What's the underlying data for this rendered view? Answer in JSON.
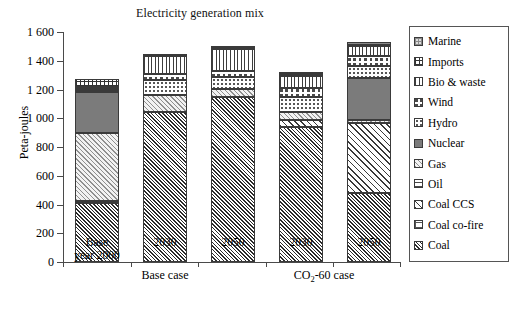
{
  "chart_data": {
    "type": "bar",
    "title": "Electricity generation mix",
    "xlabel": "",
    "ylabel": "Peta-joules",
    "ylim": [
      0,
      1600
    ],
    "yticks": [
      0,
      200,
      400,
      600,
      800,
      1000,
      1200,
      1400,
      1600
    ],
    "ytick_labels": [
      "0",
      "200",
      "400",
      "600",
      "800",
      "1 000",
      "1 200",
      "1 400",
      "1 600"
    ],
    "grid": false,
    "stacked": true,
    "legend_position": "right",
    "categories": [
      "Base year 2000",
      "2030",
      "2050",
      "2030",
      "2050"
    ],
    "category_lines": [
      [
        "Base",
        "year 2000"
      ],
      [
        "2030"
      ],
      [
        "2050"
      ],
      [
        "2030"
      ],
      [
        "2050"
      ]
    ],
    "groups": [
      {
        "label": "Base case",
        "categories": [
          "Base year 2000",
          "2030",
          "2050"
        ]
      },
      {
        "label": "CO2-60 case",
        "categories": [
          "2030",
          "2050"
        ]
      }
    ],
    "series": [
      {
        "name": "Coal",
        "pattern": "dense-diagonal-hatch",
        "values": [
          410,
          1045,
          1150,
          940,
          480
        ]
      },
      {
        "name": "Coal co-fire",
        "pattern": "fine-grid",
        "values": [
          15,
          0,
          0,
          0,
          0
        ]
      },
      {
        "name": "Coal CCS",
        "pattern": "wide-diagonal-hatch",
        "values": [
          0,
          0,
          0,
          45,
          490
        ]
      },
      {
        "name": "Oil",
        "pattern": "horizontal-lines",
        "values": [
          0,
          0,
          0,
          0,
          0
        ]
      },
      {
        "name": "Gas",
        "pattern": "light-diagonal-hatch",
        "values": [
          475,
          115,
          55,
          60,
          20
        ]
      },
      {
        "name": "Nuclear",
        "pattern": "solid-gray",
        "values": [
          285,
          0,
          0,
          0,
          290
        ]
      },
      {
        "name": "Hydro",
        "pattern": "sparse-dots",
        "values": [
          15,
          105,
          80,
          105,
          85
        ]
      },
      {
        "name": "Wind",
        "pattern": "dashed-grid",
        "values": [
          5,
          40,
          45,
          60,
          70
        ]
      },
      {
        "name": "Bio & waste",
        "pattern": "vertical-lines",
        "values": [
          10,
          130,
          150,
          85,
          65
        ]
      },
      {
        "name": "Imports",
        "pattern": "cross-hatch-grid",
        "values": [
          60,
          5,
          10,
          10,
          10
        ]
      },
      {
        "name": "Marine",
        "pattern": "fine-square-grid",
        "values": [
          0,
          0,
          5,
          5,
          20
        ]
      }
    ],
    "totals": [
      1275,
      1440,
      1495,
      1310,
      1530
    ]
  },
  "legend": {
    "items": [
      {
        "label": "Marine",
        "pattern": "p-marine"
      },
      {
        "label": "Imports",
        "pattern": "p-imports"
      },
      {
        "label": "Bio & waste",
        "pattern": "p-bio"
      },
      {
        "label": "Wind",
        "pattern": "p-wind"
      },
      {
        "label": "Hydro",
        "pattern": "p-hydro"
      },
      {
        "label": "Nuclear",
        "pattern": "p-nuclear"
      },
      {
        "label": "Gas",
        "pattern": "p-gas"
      },
      {
        "label": "Oil",
        "pattern": "p-oil"
      },
      {
        "label": "Coal CCS",
        "pattern": "p-coalccs"
      },
      {
        "label": "Coal co-fire",
        "pattern": "p-coalco"
      },
      {
        "label": "Coal",
        "pattern": "p-coal"
      }
    ]
  },
  "axis": {
    "y_label": "Peta-joules",
    "tick_0": "0",
    "tick_200": "200",
    "tick_400": "400",
    "tick_600": "600",
    "tick_800": "800",
    "tick_1000": "1 000",
    "tick_1200": "1 200",
    "tick_1400": "1 400",
    "tick_1600": "1 600"
  },
  "xaxis": {
    "bar1_line1": "Base",
    "bar1_line2": "year 2000",
    "bar2": "2030",
    "bar3": "2050",
    "bar4": "2030",
    "bar5": "2050",
    "group1": "Base case",
    "group2_pre": "CO",
    "group2_sub": "2",
    "group2_post": "-60 case"
  },
  "title": "Electricity generation mix"
}
